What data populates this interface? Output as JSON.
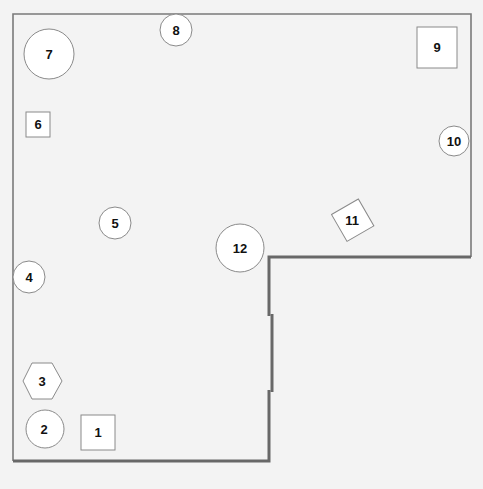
{
  "diagram": {
    "background": "#f3f3f3",
    "wall_color": "#6b6b6b",
    "shape_fill": "#ffffff",
    "shape_stroke": "#8a8a8a",
    "text_color": "#111111",
    "items": [
      {
        "id": "1",
        "label": "1",
        "shape": "square"
      },
      {
        "id": "2",
        "label": "2",
        "shape": "circle"
      },
      {
        "id": "3",
        "label": "3",
        "shape": "hexagon"
      },
      {
        "id": "4",
        "label": "4",
        "shape": "circle"
      },
      {
        "id": "5",
        "label": "5",
        "shape": "circle"
      },
      {
        "id": "6",
        "label": "6",
        "shape": "square"
      },
      {
        "id": "7",
        "label": "7",
        "shape": "circle"
      },
      {
        "id": "8",
        "label": "8",
        "shape": "circle"
      },
      {
        "id": "9",
        "label": "9",
        "shape": "square"
      },
      {
        "id": "10",
        "label": "10",
        "shape": "circle"
      },
      {
        "id": "11",
        "label": "11",
        "shape": "rotated-square"
      },
      {
        "id": "12",
        "label": "12",
        "shape": "circle"
      }
    ]
  }
}
